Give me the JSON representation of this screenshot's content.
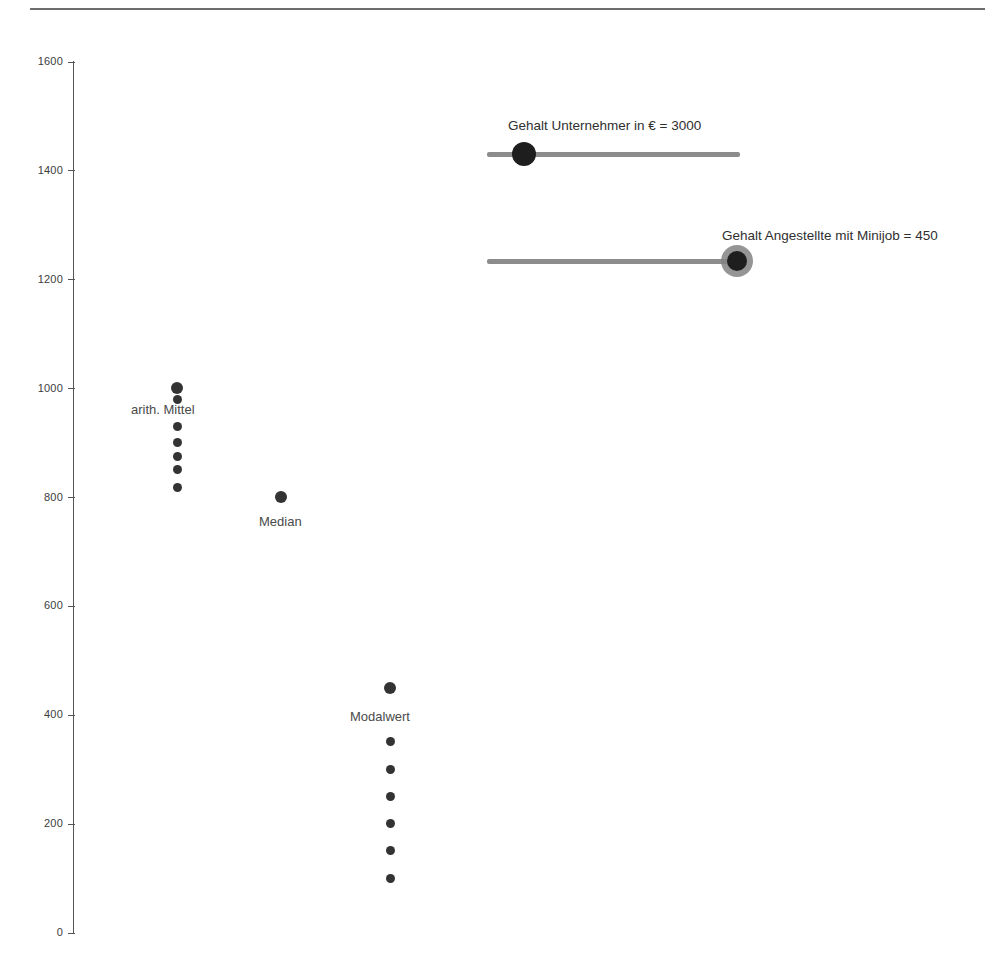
{
  "chart_data": {
    "type": "scatter",
    "title": "",
    "xlabel": "",
    "ylabel": "",
    "ylim": [
      0,
      1600
    ],
    "y_ticks": [
      0,
      200,
      400,
      600,
      800,
      1000,
      1200,
      1400,
      1600
    ],
    "y_tick_labels": [
      "0",
      "200",
      "400",
      "600",
      "800",
      "1000",
      "1200",
      "1400",
      "1600"
    ],
    "grid": false,
    "legend": "none",
    "series": [
      {
        "name": "arith. Mittel",
        "label": "arith. Mittel",
        "x": 177,
        "values": [
          1000,
          980,
          930,
          900,
          875,
          850,
          817
        ]
      },
      {
        "name": "Median",
        "label": "Median",
        "x": 281,
        "values": [
          800
        ]
      },
      {
        "name": "Modalwert",
        "label": "Modalwert",
        "x": 390,
        "values": [
          450,
          350,
          300,
          250,
          200,
          150,
          100
        ]
      }
    ],
    "annotations": [
      {
        "text": "arith. Mittel",
        "x": 131,
        "y": 403
      },
      {
        "text": "Median",
        "x": 259,
        "y": 515
      },
      {
        "text": "Modalwert",
        "x": 350,
        "y": 710
      }
    ]
  },
  "controls": {
    "sliders": [
      {
        "name": "gehalt-unternehmer",
        "label": "Gehalt Unternehmer in € = 3000",
        "value": "3000",
        "handle_position_pct": 14.6
      },
      {
        "name": "gehalt-angestellte-minijob",
        "label": "Gehalt Angestellte mit Minijob = 450",
        "value": "450",
        "handle_position_pct": 99.0
      }
    ]
  },
  "colors": {
    "dot": "#333333",
    "axis": "#555555",
    "rule": "#6d6d6d",
    "track": "#8c8c8c",
    "handle": "#1e1e1e",
    "text": "#3c3c3c"
  }
}
